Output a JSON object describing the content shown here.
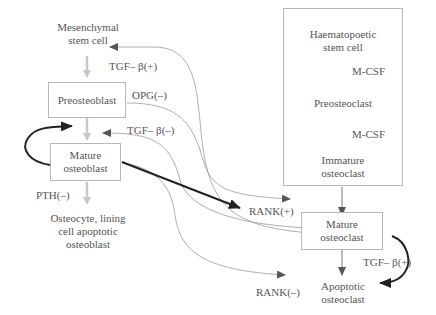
{
  "osteoblast_lineage": {
    "mesenchymal_stem_cell": "Mesenchymal\nstem cell",
    "preosteoblast": "Preosteoblast",
    "mature_osteoblast": "Mature\nosteoblast",
    "osteocyte": "Osteocyte, lining\ncell apoptotic\nosteoblast"
  },
  "osteoclast_lineage": {
    "haematopoetic_stem_cell": "Haematopoetic\nstem cell",
    "mcsf_1": "M-CSF",
    "preosteoclast": "Preosteoclast",
    "mcsf_2": "M-CSF",
    "immature_osteoclast": "Immature\nosteoclast",
    "mature_osteoclast": "Mature\nosteoclast",
    "apoptotic_osteoclast": "Apoptotic\nosteoclast"
  },
  "signals": {
    "tgf_beta_plus_top": "TGF– β(+)",
    "opg_minus": "OPG(–)",
    "tgf_beta_minus": "TGF– β(–)",
    "pth_minus": "PTH(–)",
    "rank_plus": "RANK(+)",
    "rank_minus": "RANK(–)",
    "tgf_beta_plus_right": "TGF– β(+)"
  },
  "colors": {
    "light_arrow": "#c8c8c8",
    "thin_line": "#9a9a9a",
    "dark_arrow": "#222222",
    "box_border": "#b8b8b8",
    "text": "#555555"
  }
}
